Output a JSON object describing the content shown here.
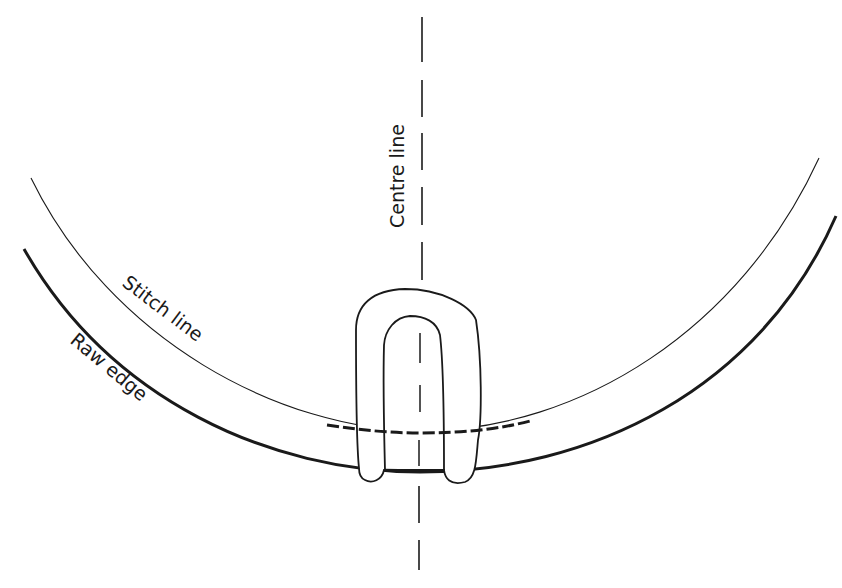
{
  "diagram": {
    "type": "sewing-illustration",
    "labels": {
      "centre_line": "Centre line",
      "stitch_line": "Stitch line",
      "raw_edge": "Raw edge"
    },
    "colors": {
      "background": "#ffffff",
      "ink": "#1a1a1a"
    }
  }
}
